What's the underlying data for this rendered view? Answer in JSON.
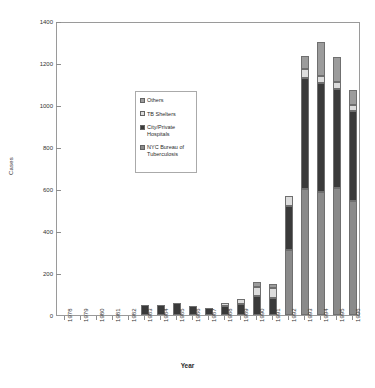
{
  "chart_data": {
    "type": "bar",
    "subtype": "stacked-bar",
    "title": "",
    "xlabel": "Year",
    "ylabel": "Cases",
    "ylim": [
      0,
      1400
    ],
    "ytick_step": 200,
    "yticks": [
      0,
      200,
      400,
      600,
      800,
      1000,
      1200,
      1400
    ],
    "grid": false,
    "legend_position": "inside-upper-left",
    "categories": [
      "1978",
      "1979",
      "1980",
      "1981",
      "1982",
      "1983",
      "1984",
      "1985",
      "1986",
      "1987",
      "1988",
      "1989",
      "1990",
      "1991",
      "1992",
      "1993",
      "1994",
      "1995",
      "1996"
    ],
    "series": [
      {
        "name": "NYC Bureau of Tuberculosis",
        "color": "#8a8a8a",
        "values": [
          0,
          0,
          0,
          0,
          0,
          0,
          0,
          0,
          0,
          0,
          0,
          0,
          0,
          0,
          310,
          600,
          585,
          605,
          545
        ]
      },
      {
        "name": "City/Private Hospitals",
        "color": "#3a3a3a",
        "values": [
          0,
          0,
          0,
          0,
          0,
          50,
          48,
          55,
          45,
          32,
          45,
          52,
          90,
          82,
          210,
          530,
          520,
          470,
          425
        ]
      },
      {
        "name": "TB Shelters",
        "color": "#dcdcdc",
        "values": [
          0,
          0,
          0,
          0,
          0,
          0,
          0,
          0,
          0,
          0,
          12,
          25,
          45,
          48,
          48,
          40,
          32,
          35,
          30
        ]
      },
      {
        "name": "Others",
        "color": "#9c9c9c",
        "values": [
          0,
          0,
          0,
          0,
          0,
          0,
          0,
          0,
          0,
          0,
          0,
          0,
          22,
          18,
          0,
          65,
          165,
          120,
          72
        ]
      }
    ],
    "legend": [
      {
        "label": "Others",
        "color": "#9c9c9c"
      },
      {
        "label": "TB Shelters",
        "color": "#dcdcdc"
      },
      {
        "label": "City/Private Hospitals",
        "color": "#3a3a3a"
      },
      {
        "label": "NYC Bureau of Tuberculosis",
        "color": "#8a8a8a"
      }
    ]
  },
  "axes": {
    "y_title": "Cases",
    "x_title": "Year"
  }
}
